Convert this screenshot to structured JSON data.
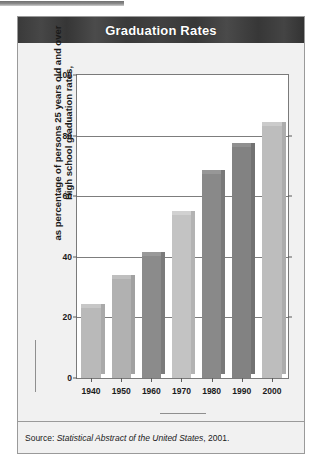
{
  "figure": {
    "title": "Graduation Rates",
    "source_prefix": "Source:",
    "source_italic": "Statistical Abstract of the United States",
    "source_suffix": ", 2001."
  },
  "axes": {
    "y_title_line1": "High school graduation rates,",
    "y_title_line2": "as percentage of persons 25 years old and over",
    "x_title": "School Year"
  },
  "chart_data": {
    "type": "bar",
    "title": "Graduation Rates",
    "xlabel": "School Year",
    "ylabel": "High school graduation rates, as percentage of persons 25 years old and over",
    "categories": [
      "1940",
      "1950",
      "1960",
      "1970",
      "1980",
      "1990",
      "2000"
    ],
    "values": [
      24.5,
      34,
      41.5,
      55,
      68.5,
      77.5,
      84.5
    ],
    "series": [
      {
        "name": "High school graduation rate",
        "values": [
          24.5,
          34,
          41.5,
          55,
          68.5,
          77.5,
          84.5
        ]
      }
    ],
    "bar_colors": [
      "#b9b9b9",
      "#b1b1b1",
      "#8b8b8b",
      "#c3c3c3",
      "#898989",
      "#828282",
      "#bdbdbd"
    ],
    "ylim": [
      0,
      100
    ],
    "yticks": [
      0,
      20,
      40,
      60,
      80,
      100
    ],
    "ytick_labels": [
      "0",
      "20",
      "40",
      "60",
      "80",
      "100"
    ],
    "grid": true,
    "legend": "none",
    "source": "Source: Statistical Abstract of the United States, 2001."
  },
  "colors": {
    "banner": "#3b3b3b",
    "banner_text": "#ffffff",
    "page_background": "#f1f1f1",
    "plot_background": "#ffffff",
    "gridline": "#7d7d7d",
    "bar_light": "#bdbdbd",
    "bar_dark": "#888888"
  }
}
